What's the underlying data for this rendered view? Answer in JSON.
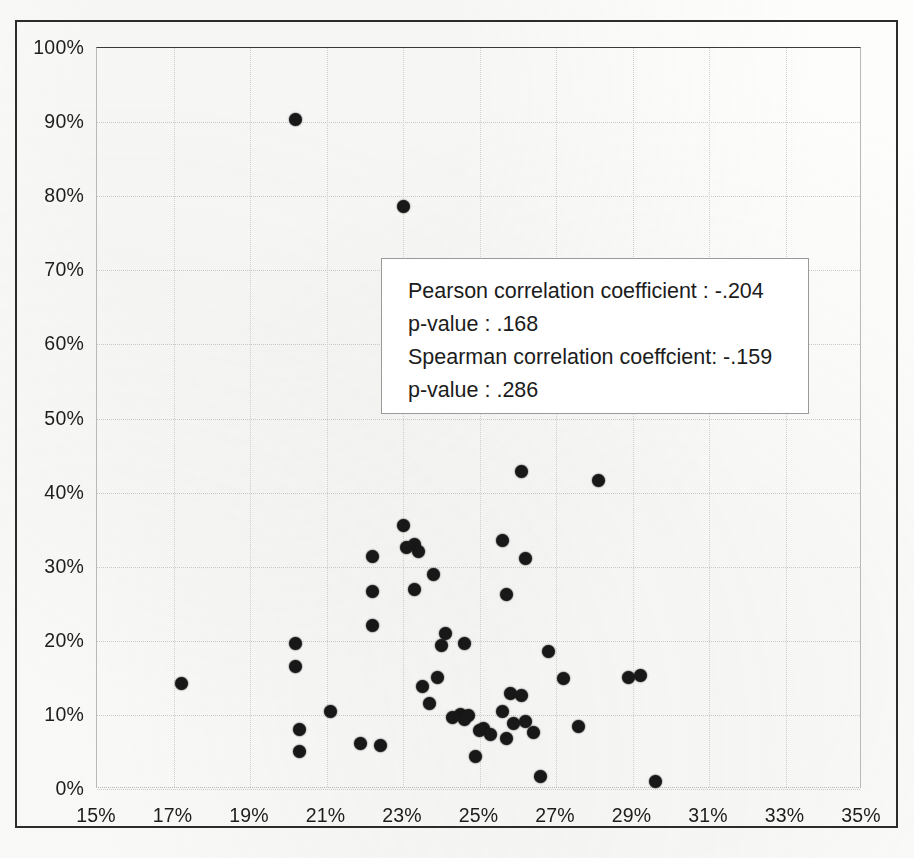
{
  "chart_data": {
    "type": "scatter",
    "title": "",
    "subtitle": "",
    "xlabel": "",
    "ylabel": "",
    "xlim": [
      15,
      35
    ],
    "ylim": [
      0,
      100
    ],
    "x_unit": "%",
    "y_unit": "%",
    "grid": true,
    "legend": "none",
    "xticks": [
      15,
      17,
      19,
      21,
      23,
      25,
      27,
      29,
      31,
      33,
      35
    ],
    "xtick_labels": [
      "15%",
      "17%",
      "19%",
      "21%",
      "23%",
      "25%",
      "27%",
      "29%",
      "31%",
      "33%",
      "35%"
    ],
    "yticks": [
      0,
      10,
      20,
      30,
      40,
      50,
      60,
      70,
      80,
      90,
      100
    ],
    "ytick_labels": [
      "0%",
      "10%",
      "20%",
      "30%",
      "40%",
      "50%",
      "60%",
      "70%",
      "80%",
      "90%",
      "100%"
    ],
    "marker_color": "#181818",
    "marker_shape": "circle",
    "n_points": 52,
    "points": [
      {
        "x": 20.2,
        "y": 90.4
      },
      {
        "x": 23.0,
        "y": 78.6
      },
      {
        "x": 26.1,
        "y": 42.8
      },
      {
        "x": 28.1,
        "y": 41.6
      },
      {
        "x": 23.0,
        "y": 35.6
      },
      {
        "x": 25.6,
        "y": 33.6
      },
      {
        "x": 23.3,
        "y": 33.0
      },
      {
        "x": 23.4,
        "y": 32.1
      },
      {
        "x": 22.2,
        "y": 31.4
      },
      {
        "x": 26.2,
        "y": 31.1
      },
      {
        "x": 23.8,
        "y": 28.9
      },
      {
        "x": 23.3,
        "y": 26.9
      },
      {
        "x": 22.2,
        "y": 26.6
      },
      {
        "x": 25.7,
        "y": 26.2
      },
      {
        "x": 22.2,
        "y": 22.0
      },
      {
        "x": 24.1,
        "y": 21.0
      },
      {
        "x": 20.2,
        "y": 19.7
      },
      {
        "x": 24.6,
        "y": 19.6
      },
      {
        "x": 26.8,
        "y": 18.6
      },
      {
        "x": 20.2,
        "y": 16.5
      },
      {
        "x": 27.2,
        "y": 14.9
      },
      {
        "x": 28.9,
        "y": 15.1
      },
      {
        "x": 29.2,
        "y": 15.3
      },
      {
        "x": 23.9,
        "y": 15.0
      },
      {
        "x": 17.2,
        "y": 14.2
      },
      {
        "x": 23.5,
        "y": 13.9
      },
      {
        "x": 25.8,
        "y": 12.9
      },
      {
        "x": 26.1,
        "y": 12.6
      },
      {
        "x": 23.7,
        "y": 11.6
      },
      {
        "x": 25.6,
        "y": 10.4
      },
      {
        "x": 24.5,
        "y": 10.1
      },
      {
        "x": 24.7,
        "y": 9.9
      },
      {
        "x": 24.6,
        "y": 9.4
      },
      {
        "x": 26.2,
        "y": 9.1
      },
      {
        "x": 21.1,
        "y": 10.5
      },
      {
        "x": 25.9,
        "y": 8.9
      },
      {
        "x": 27.6,
        "y": 8.5
      },
      {
        "x": 25.1,
        "y": 8.2
      },
      {
        "x": 20.3,
        "y": 8.0
      },
      {
        "x": 25.0,
        "y": 7.9
      },
      {
        "x": 25.7,
        "y": 6.8
      },
      {
        "x": 21.9,
        "y": 6.1
      },
      {
        "x": 22.4,
        "y": 5.9
      },
      {
        "x": 20.3,
        "y": 5.0
      },
      {
        "x": 24.9,
        "y": 4.4
      },
      {
        "x": 26.6,
        "y": 1.7
      },
      {
        "x": 29.6,
        "y": 1.0
      },
      {
        "x": 24.3,
        "y": 9.6
      },
      {
        "x": 25.3,
        "y": 7.4
      },
      {
        "x": 23.1,
        "y": 32.6
      },
      {
        "x": 24.0,
        "y": 19.4
      },
      {
        "x": 26.4,
        "y": 7.6
      }
    ]
  },
  "annotation": {
    "lines": [
      "Pearson correlation coefficient : -.204",
      "p-value : .168",
      "Spearman correlation coeffcient: -.159",
      "p-value : .286"
    ],
    "pearson_r": "-.204",
    "pearson_p": ".168",
    "spearman_rho": "-.159",
    "spearman_p": ".286"
  }
}
